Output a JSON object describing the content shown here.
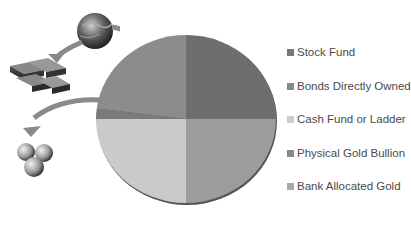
{
  "title": "",
  "chart_data": {
    "type": "pie",
    "title": "",
    "categories": [
      "Stock Fund",
      "Bonds Directly Owned",
      "Cash Fund or Ladder",
      "Physical Gold Bullion",
      "Bank Allocated Gold"
    ],
    "values": [
      25,
      25,
      25,
      2,
      23
    ],
    "colors": [
      "#6e6e6e",
      "#9c9c9c",
      "#cacaca",
      "#7a7a7a",
      "#8c8c8c"
    ],
    "legend_position": "right",
    "start_angle_deg": 90,
    "direction": "clockwise"
  },
  "legend": {
    "items": [
      {
        "label": "Stock Fund",
        "color": "#777777"
      },
      {
        "label": "Bonds Directly Owned",
        "color": "#8a8a8a"
      },
      {
        "label": "Cash Fund or Ladder",
        "color": "#cccccc"
      },
      {
        "label": "Physical Gold Bullion",
        "color": "#8a8a8a"
      },
      {
        "label": "Bank Allocated Gold",
        "color": "#aaaaaa"
      }
    ]
  },
  "illustration": {
    "icons": [
      "globe-icon",
      "gold-bars-icon",
      "coins-icon",
      "curved-arrow-icon"
    ]
  }
}
